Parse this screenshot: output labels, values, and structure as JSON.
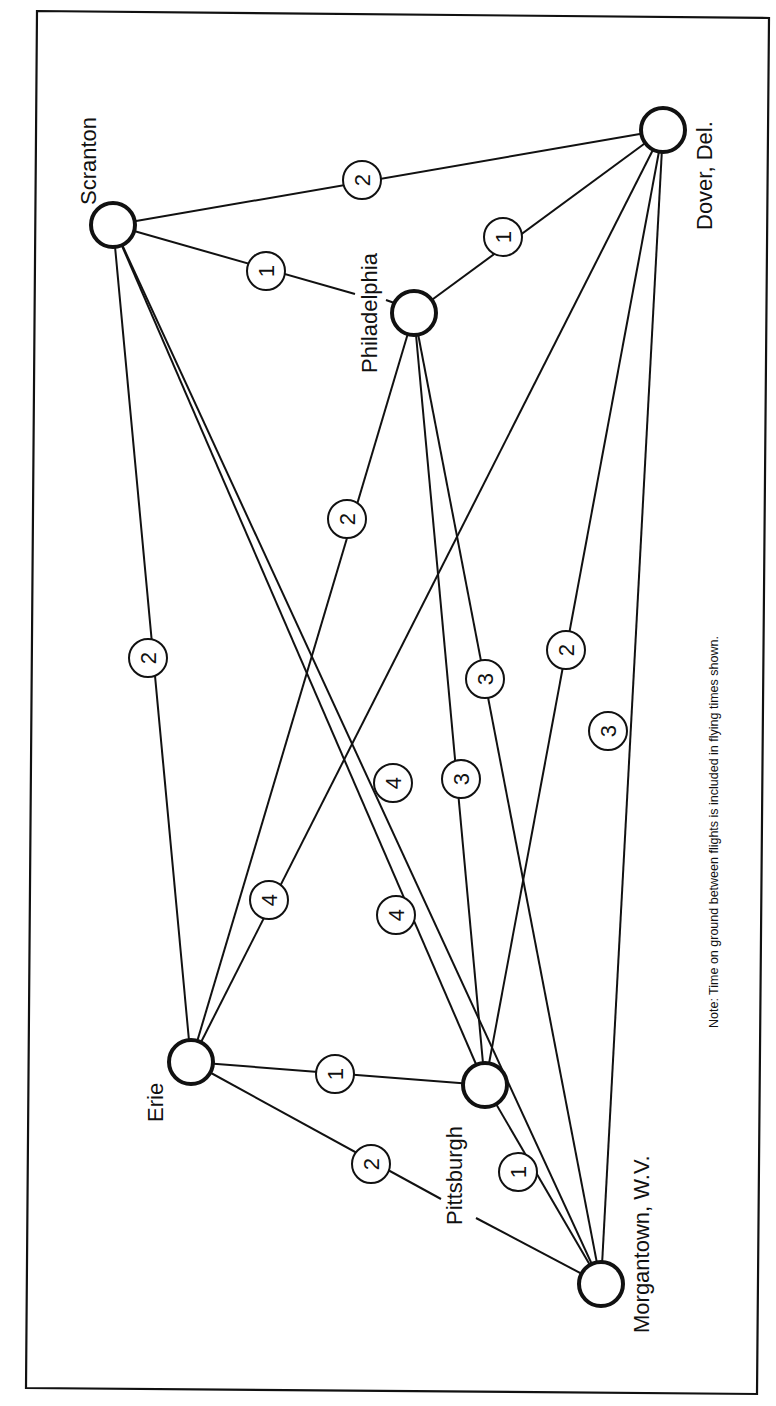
{
  "diagram": {
    "note": "Note: Time on ground between flights is included in flying times shown.",
    "orientation": "rotated 90° counter-clockwise",
    "colors": {
      "ink": "#111111",
      "paper": "#ffffff"
    },
    "nodes": [
      {
        "id": "scranton",
        "label": "Scranton",
        "x": 113,
        "y": 225
      },
      {
        "id": "philadelphia",
        "label": "Philadelphia",
        "x": 414,
        "y": 313
      },
      {
        "id": "dover",
        "label": "Dover,  Del.",
        "x": 663,
        "y": 130
      },
      {
        "id": "erie",
        "label": "Erie",
        "x": 191,
        "y": 1062
      },
      {
        "id": "pittsburgh",
        "label": "Pittsburgh",
        "x": 485,
        "y": 1085
      },
      {
        "id": "morgantown",
        "label": "Morgantown,  W.V.",
        "x": 601,
        "y": 1284
      }
    ],
    "edges": [
      {
        "from": "Scranton",
        "to": "Dover, Del.",
        "hours": "2",
        "lx": 362,
        "ly": 180
      },
      {
        "from": "Scranton",
        "to": "Philadelphia",
        "hours": "1",
        "lx": 266,
        "ly": 271
      },
      {
        "from": "Philadelphia",
        "to": "Dover, Del.",
        "hours": "1",
        "lx": 503,
        "ly": 237
      },
      {
        "from": "Scranton",
        "to": "Erie",
        "hours": "2",
        "lx": 148,
        "ly": 658
      },
      {
        "from": "Scranton",
        "to": "Pittsburgh",
        "hours": "4",
        "lx": 396,
        "ly": 915
      },
      {
        "from": "Scranton",
        "to": "Morgantown, W.V.",
        "hours": "4",
        "lx": 393,
        "ly": 783
      },
      {
        "from": "Philadelphia",
        "to": "Erie",
        "hours": "2",
        "lx": 347,
        "ly": 519
      },
      {
        "from": "Philadelphia",
        "to": "Pittsburgh",
        "hours": "3",
        "lx": 461,
        "ly": 779
      },
      {
        "from": "Philadelphia",
        "to": "Morgantown, W.V.",
        "hours": "3",
        "lx": 485,
        "ly": 679
      },
      {
        "from": "Dover, Del.",
        "to": "Erie",
        "hours": "4",
        "lx": 269,
        "ly": 900
      },
      {
        "from": "Dover, Del.",
        "to": "Pittsburgh",
        "hours": "2",
        "lx": 566,
        "ly": 650
      },
      {
        "from": "Dover, Del.",
        "to": "Morgantown, W.V.",
        "hours": "3",
        "lx": 608,
        "ly": 731
      },
      {
        "from": "Erie",
        "to": "Pittsburgh",
        "hours": "1",
        "lx": 335,
        "ly": 1074
      },
      {
        "from": "Erie",
        "to": "Morgantown, W.V.",
        "hours": "2",
        "lx": 371,
        "ly": 1164
      },
      {
        "from": "Pittsburgh",
        "to": "Morgantown, W.V.",
        "hours": "1",
        "lx": 518,
        "ly": 1172
      }
    ]
  }
}
